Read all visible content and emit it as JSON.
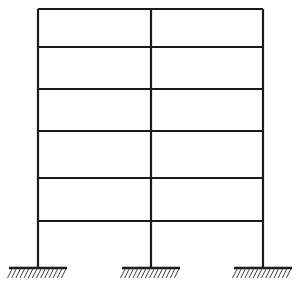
{
  "figure": {
    "name": "multi-story-plane-frame",
    "width": 297,
    "height": 293,
    "background_color": "#ffffff",
    "line_color": "#1a1a1a",
    "member_stroke_width": 2.2,
    "hatch_color": "#2b2b2b",
    "hatch_stroke_width": 0.9
  },
  "geometry": {
    "columns": [
      {
        "id": "column-left",
        "x": 38,
        "y_top": 9,
        "y_bottom": 268
      },
      {
        "id": "column-middle",
        "x": 151,
        "y_top": 9,
        "y_bottom": 268
      },
      {
        "id": "column-right",
        "x": 263,
        "y_top": 9,
        "y_bottom": 268
      }
    ],
    "beams": [
      {
        "id": "beam-level-6",
        "y": 9,
        "x_start": 38,
        "x_end": 263
      },
      {
        "id": "beam-level-5",
        "y": 47,
        "x_start": 38,
        "x_end": 263
      },
      {
        "id": "beam-level-4",
        "y": 89,
        "x_start": 38,
        "x_end": 263
      },
      {
        "id": "beam-level-3",
        "y": 131,
        "x_start": 38,
        "x_end": 263
      },
      {
        "id": "beam-level-2",
        "y": 178,
        "x_start": 38,
        "x_end": 263
      },
      {
        "id": "beam-level-1",
        "y": 221,
        "x_start": 38,
        "x_end": 263
      }
    ],
    "supports": [
      {
        "id": "support-left",
        "type": "fixed",
        "x": 38,
        "y": 268,
        "half_width": 29,
        "hatch_count": 14
      },
      {
        "id": "support-middle",
        "type": "fixed",
        "x": 151,
        "y": 268,
        "half_width": 29,
        "hatch_count": 14
      },
      {
        "id": "support-right",
        "type": "fixed",
        "x": 263,
        "y": 268,
        "half_width": 29,
        "hatch_count": 14
      }
    ],
    "hatch": {
      "length": 11,
      "dx": -5,
      "dy": 10
    }
  },
  "counts": {
    "stories": 6,
    "bays": 2,
    "columns": 3,
    "beams": 6,
    "supports": 3
  }
}
